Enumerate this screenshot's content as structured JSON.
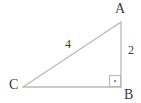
{
  "figure": {
    "background_color": "#ffffff",
    "line_color": "#b9b9b9",
    "label_color": "#3b3b3b",
    "vertices": [
      {
        "name": "A",
        "label": "A",
        "x": 121,
        "y": 22
      },
      {
        "name": "B",
        "label": "B",
        "x": 121,
        "y": 87
      },
      {
        "name": "C",
        "label": "C",
        "x": 23,
        "y": 87
      }
    ],
    "sides": [
      {
        "name": "hypotenuse-CA",
        "label": "4",
        "from": "C",
        "to": "A"
      },
      {
        "name": "leg-AB",
        "label": "2",
        "from": "A",
        "to": "B"
      },
      {
        "name": "leg-CB",
        "label": "",
        "from": "C",
        "to": "B"
      }
    ],
    "right_angle": {
      "at_vertex": "B",
      "marker": "square-with-dot",
      "x": 110,
      "y": 76,
      "size": 11
    }
  },
  "labels": {
    "vertex_a": "A",
    "vertex_b": "B",
    "vertex_c": "C",
    "side_hypotenuse": "4",
    "side_vertical": "2"
  }
}
